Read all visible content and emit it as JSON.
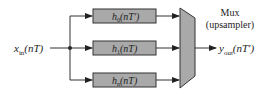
{
  "diagram": {
    "input": {
      "symbol": "x",
      "subscript": "in",
      "argument": "(nT)"
    },
    "filters": [
      {
        "symbol": "h",
        "subscript": "0",
        "argument": "(nT′)"
      },
      {
        "symbol": "h",
        "subscript": "1",
        "argument": "(nT)"
      },
      {
        "symbol": "h",
        "subscript": "n",
        "argument": "(nT)"
      }
    ],
    "mux": {
      "title": "Mux",
      "subtitle": "(upsampler)"
    },
    "output": {
      "symbol": "y",
      "subscript": "out",
      "argument": "(nT′)"
    },
    "colors": {
      "block_fill": "#a9a9a9",
      "stroke": "#333333",
      "text": "#222222"
    }
  }
}
